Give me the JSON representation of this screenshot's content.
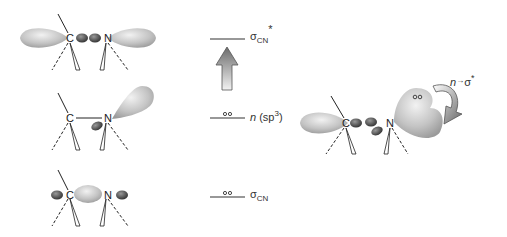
{
  "diagram": {
    "type": "molecular-orbital-diagram",
    "atoms": {
      "carbon": "C",
      "nitrogen": "N"
    },
    "levels": [
      {
        "id": "sigma_star",
        "label": "σ",
        "subscript": "CN",
        "superscript": "*",
        "electrons": 0
      },
      {
        "id": "n_sp3",
        "label": "n",
        "paren": "(sp",
        "paren_sup": "3",
        "paren_close": ")",
        "electrons": 2
      },
      {
        "id": "sigma",
        "label": "σ",
        "subscript": "CN",
        "electrons": 2
      }
    ],
    "transition": {
      "from": "n",
      "arrow": "→",
      "to": "σ",
      "to_sup": "*"
    }
  }
}
